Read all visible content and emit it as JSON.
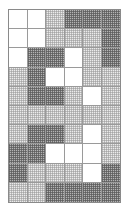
{
  "figure": {
    "name": "shaded-grid-pattern",
    "columns": 6,
    "rows": 10,
    "border_color": "#8a8a8a",
    "gridline_color": "#9a9a9a",
    "shade_levels": {
      "white": "#ffffff",
      "light": "#ebebeb",
      "dark": "#b4b4b4"
    },
    "legend": [
      "white",
      "light",
      "dark"
    ],
    "cells": [
      [
        "white",
        "white",
        "light",
        "dark",
        "dark",
        "dark"
      ],
      [
        "white",
        "white",
        "light",
        "light",
        "light",
        "dark"
      ],
      [
        "white",
        "dark",
        "dark",
        "white",
        "light",
        "dark"
      ],
      [
        "light",
        "dark",
        "white",
        "white",
        "light",
        "light"
      ],
      [
        "light",
        "dark",
        "dark",
        "light",
        "white",
        "light"
      ],
      [
        "light",
        "light",
        "light",
        "light",
        "light",
        "light"
      ],
      [
        "light",
        "dark",
        "dark",
        "light",
        "white",
        "light"
      ],
      [
        "dark",
        "dark",
        "white",
        "white",
        "white",
        "light"
      ],
      [
        "dark",
        "light",
        "light",
        "light",
        "white",
        "dark"
      ],
      [
        "light",
        "light",
        "dark",
        "dark",
        "dark",
        "dark"
      ]
    ]
  }
}
